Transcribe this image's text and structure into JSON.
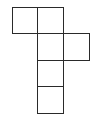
{
  "diagram": {
    "type": "cube-net",
    "square_count": 6,
    "stroke_color": "#2a2a2a",
    "fill_color": "#ffffff",
    "squares": [
      {
        "id": "top-left",
        "x": 12,
        "y": 7,
        "size": 26
      },
      {
        "id": "top-center",
        "x": 37,
        "y": 7,
        "size": 26
      },
      {
        "id": "middle-center",
        "x": 37,
        "y": 33,
        "size": 27
      },
      {
        "id": "middle-right",
        "x": 63,
        "y": 33,
        "size": 27
      },
      {
        "id": "lower-center",
        "x": 37,
        "y": 60,
        "size": 27
      },
      {
        "id": "bottom-center",
        "x": 37,
        "y": 86,
        "size": 27
      }
    ]
  }
}
